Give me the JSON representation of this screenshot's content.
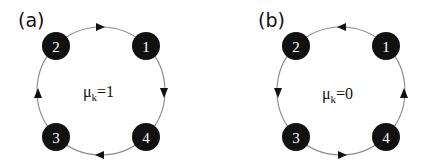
{
  "panels": [
    {
      "label": "(a)",
      "center": [
        101,
        91
      ],
      "radius": 64,
      "mu_symbol": "μ",
      "mu_sub": "k",
      "mu_value": "=1",
      "direction": "clockwise",
      "nodes": [
        {
          "id": "1",
          "x": 146,
          "y": 46
        },
        {
          "id": "2",
          "x": 56,
          "y": 46
        },
        {
          "id": "3",
          "x": 56,
          "y": 137
        },
        {
          "id": "4",
          "x": 146,
          "y": 137
        }
      ],
      "edges": [
        {
          "from": "2",
          "to": "1"
        },
        {
          "from": "1",
          "to": "4"
        },
        {
          "from": "4",
          "to": "3"
        },
        {
          "from": "3",
          "to": "2"
        }
      ]
    },
    {
      "label": "(b)",
      "center": [
        341,
        91
      ],
      "radius": 64,
      "mu_symbol": "μ",
      "mu_sub": "k",
      "mu_value": "=0",
      "direction": "counterclockwise",
      "nodes": [
        {
          "id": "1",
          "x": 386,
          "y": 46
        },
        {
          "id": "2",
          "x": 296,
          "y": 46
        },
        {
          "id": "3",
          "x": 296,
          "y": 137
        },
        {
          "id": "4",
          "x": 386,
          "y": 137
        }
      ],
      "edges": [
        {
          "from": "1",
          "to": "2"
        },
        {
          "from": "2",
          "to": "3"
        },
        {
          "from": "3",
          "to": "4"
        },
        {
          "from": "4",
          "to": "1"
        }
      ]
    }
  ],
  "colors": {
    "node_fill": "#111111",
    "node_text": "#ffffff",
    "ring": "#8a8a8a",
    "arrow": "#111111"
  }
}
